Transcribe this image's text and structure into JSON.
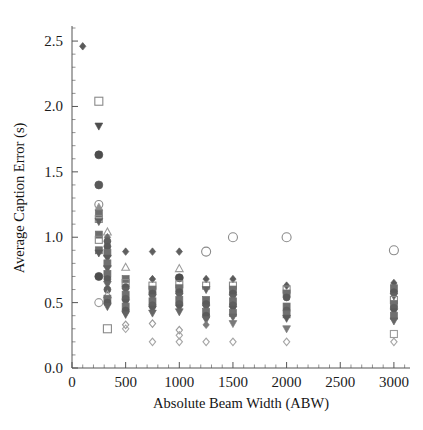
{
  "chart_data": {
    "type": "scatter",
    "title": "",
    "xlabel": "Absolute Beam Width (ABW)",
    "ylabel": "Average Caption Error (s)",
    "xlim": [
      0,
      3150
    ],
    "ylim": [
      0.0,
      2.6
    ],
    "xticks": [
      0,
      500,
      1000,
      1500,
      2000,
      2500,
      3000
    ],
    "xticklabels": [
      "0",
      "500",
      "1000",
      "1500",
      "2000",
      "2500",
      "3000"
    ],
    "yticks": [
      0.0,
      0.5,
      1.0,
      1.5,
      2.0,
      2.5
    ],
    "yticklabels": [
      "0.0",
      "0.5",
      "1.0",
      "1.5",
      "2.0",
      "2.5"
    ],
    "x_minor_tick_step": 100,
    "y_minor_tick_step": 0.1,
    "grid": false,
    "legend": null,
    "marker_shapes": [
      "circle-open",
      "circle-filled",
      "square-open",
      "square-filled",
      "triangle-up-open",
      "triangle-up-filled",
      "triangle-down-filled",
      "diamond-open",
      "diamond-filled"
    ],
    "marker_colors": {
      "dark_gray": "#4d4d4d",
      "mid_gray": "#6e6e6e",
      "light_gray": "#9b9b9b",
      "outline_gray": "#8a8a8a"
    },
    "points": [
      {
        "x": 100,
        "y": 2.46,
        "shape": "diamond-filled",
        "color": "#5a5a5a",
        "size": 6
      },
      {
        "x": 250,
        "y": 2.04,
        "shape": "square-open",
        "color": "#8a8a8a",
        "size": 8
      },
      {
        "x": 250,
        "y": 1.85,
        "shape": "triangle-down-filled",
        "color": "#4d4d4d",
        "size": 7
      },
      {
        "x": 250,
        "y": 1.63,
        "shape": "circle-filled",
        "color": "#4d4d4d",
        "size": 8
      },
      {
        "x": 250,
        "y": 1.4,
        "shape": "circle-filled",
        "color": "#595959",
        "size": 8
      },
      {
        "x": 250,
        "y": 1.25,
        "shape": "circle-open",
        "color": "#8a8a8a",
        "size": 8
      },
      {
        "x": 250,
        "y": 1.23,
        "shape": "triangle-up-filled",
        "color": "#909090",
        "size": 7
      },
      {
        "x": 250,
        "y": 1.18,
        "shape": "square-filled",
        "color": "#6e6e6e",
        "size": 7
      },
      {
        "x": 250,
        "y": 1.14,
        "shape": "square-open",
        "color": "#8a8a8a",
        "size": 7
      },
      {
        "x": 250,
        "y": 1.12,
        "shape": "triangle-down-filled",
        "color": "#5f5f5f",
        "size": 7
      },
      {
        "x": 250,
        "y": 1.02,
        "shape": "square-filled",
        "color": "#6e6e6e",
        "size": 7
      },
      {
        "x": 250,
        "y": 0.98,
        "shape": "square-open",
        "color": "#8a8a8a",
        "size": 7
      },
      {
        "x": 250,
        "y": 0.9,
        "shape": "square-filled",
        "color": "#6e6e6e",
        "size": 7
      },
      {
        "x": 250,
        "y": 0.88,
        "shape": "triangle-down-filled",
        "color": "#5a5a5a",
        "size": 7
      },
      {
        "x": 250,
        "y": 0.7,
        "shape": "circle-filled",
        "color": "#4d4d4d",
        "size": 8
      },
      {
        "x": 250,
        "y": 0.5,
        "shape": "circle-open",
        "color": "#9b9b9b",
        "size": 8
      },
      {
        "x": 330,
        "y": 1.04,
        "shape": "triangle-up-open",
        "color": "#9b9b9b",
        "size": 7
      },
      {
        "x": 330,
        "y": 1.0,
        "shape": "diamond-filled",
        "color": "#6e6e6e",
        "size": 6
      },
      {
        "x": 330,
        "y": 0.97,
        "shape": "circle-filled",
        "color": "#5f5f5f",
        "size": 7
      },
      {
        "x": 330,
        "y": 0.93,
        "shape": "circle-filled",
        "color": "#5a5a5a",
        "size": 7
      },
      {
        "x": 330,
        "y": 0.88,
        "shape": "square-filled",
        "color": "#6e6e6e",
        "size": 7
      },
      {
        "x": 330,
        "y": 0.84,
        "shape": "triangle-down-filled",
        "color": "#5a5a5a",
        "size": 7
      },
      {
        "x": 330,
        "y": 0.8,
        "shape": "square-filled",
        "color": "#707070",
        "size": 7
      },
      {
        "x": 330,
        "y": 0.76,
        "shape": "triangle-down-filled",
        "color": "#626262",
        "size": 7
      },
      {
        "x": 330,
        "y": 0.72,
        "shape": "square-filled",
        "color": "#6e6e6e",
        "size": 7
      },
      {
        "x": 330,
        "y": 0.68,
        "shape": "circle-filled",
        "color": "#5a5a5a",
        "size": 7
      },
      {
        "x": 330,
        "y": 0.64,
        "shape": "triangle-down-filled",
        "color": "#666666",
        "size": 7
      },
      {
        "x": 330,
        "y": 0.6,
        "shape": "circle-filled",
        "color": "#5f5f5f",
        "size": 7
      },
      {
        "x": 330,
        "y": 0.56,
        "shape": "triangle-up-open",
        "color": "#9b9b9b",
        "size": 7
      },
      {
        "x": 330,
        "y": 0.53,
        "shape": "square-filled",
        "color": "#6e6e6e",
        "size": 7
      },
      {
        "x": 330,
        "y": 0.5,
        "shape": "circle-filled",
        "color": "#5a5a5a",
        "size": 7
      },
      {
        "x": 330,
        "y": 0.47,
        "shape": "triangle-down-filled",
        "color": "#626262",
        "size": 7
      },
      {
        "x": 330,
        "y": 0.3,
        "shape": "square-open",
        "color": "#8a8a8a",
        "size": 8
      },
      {
        "x": 500,
        "y": 0.89,
        "shape": "diamond-filled",
        "color": "#5f5f5f",
        "size": 6
      },
      {
        "x": 500,
        "y": 0.77,
        "shape": "triangle-up-open",
        "color": "#9b9b9b",
        "size": 7
      },
      {
        "x": 500,
        "y": 0.68,
        "shape": "square-filled",
        "color": "#6e6e6e",
        "size": 7
      },
      {
        "x": 500,
        "y": 0.65,
        "shape": "square-open",
        "color": "#8a8a8a",
        "size": 7
      },
      {
        "x": 500,
        "y": 0.62,
        "shape": "circle-filled",
        "color": "#5a5a5a",
        "size": 7
      },
      {
        "x": 500,
        "y": 0.59,
        "shape": "triangle-down-filled",
        "color": "#626262",
        "size": 7
      },
      {
        "x": 500,
        "y": 0.56,
        "shape": "square-filled",
        "color": "#6e6e6e",
        "size": 7
      },
      {
        "x": 500,
        "y": 0.53,
        "shape": "circle-filled",
        "color": "#5f5f5f",
        "size": 7
      },
      {
        "x": 500,
        "y": 0.5,
        "shape": "triangle-down-filled",
        "color": "#5a5a5a",
        "size": 7
      },
      {
        "x": 500,
        "y": 0.47,
        "shape": "square-filled",
        "color": "#707070",
        "size": 7
      },
      {
        "x": 500,
        "y": 0.44,
        "shape": "circle-filled",
        "color": "#5a5a5a",
        "size": 7
      },
      {
        "x": 500,
        "y": 0.41,
        "shape": "triangle-down-filled",
        "color": "#626262",
        "size": 7
      },
      {
        "x": 500,
        "y": 0.33,
        "shape": "diamond-open",
        "color": "#9b9b9b",
        "size": 6
      },
      {
        "x": 500,
        "y": 0.3,
        "shape": "diamond-open",
        "color": "#a5a5a5",
        "size": 6
      },
      {
        "x": 750,
        "y": 0.89,
        "shape": "diamond-filled",
        "color": "#5f5f5f",
        "size": 6
      },
      {
        "x": 750,
        "y": 0.68,
        "shape": "diamond-filled",
        "color": "#5a5a5a",
        "size": 6
      },
      {
        "x": 750,
        "y": 0.63,
        "shape": "square-open",
        "color": "#8a8a8a",
        "size": 7
      },
      {
        "x": 750,
        "y": 0.6,
        "shape": "square-filled",
        "color": "#6e6e6e",
        "size": 7
      },
      {
        "x": 750,
        "y": 0.57,
        "shape": "circle-filled",
        "color": "#5a5a5a",
        "size": 7
      },
      {
        "x": 750,
        "y": 0.54,
        "shape": "triangle-down-filled",
        "color": "#626262",
        "size": 7
      },
      {
        "x": 750,
        "y": 0.51,
        "shape": "square-filled",
        "color": "#6e6e6e",
        "size": 7
      },
      {
        "x": 750,
        "y": 0.48,
        "shape": "circle-filled",
        "color": "#5f5f5f",
        "size": 7
      },
      {
        "x": 750,
        "y": 0.45,
        "shape": "triangle-down-filled",
        "color": "#5a5a5a",
        "size": 7
      },
      {
        "x": 750,
        "y": 0.42,
        "shape": "triangle-down-filled",
        "color": "#666666",
        "size": 7
      },
      {
        "x": 750,
        "y": 0.34,
        "shape": "diamond-open",
        "color": "#9b9b9b",
        "size": 6
      },
      {
        "x": 750,
        "y": 0.2,
        "shape": "diamond-open",
        "color": "#a5a5a5",
        "size": 6
      },
      {
        "x": 1000,
        "y": 0.89,
        "shape": "diamond-filled",
        "color": "#5f5f5f",
        "size": 6
      },
      {
        "x": 1000,
        "y": 0.76,
        "shape": "triangle-up-open",
        "color": "#9b9b9b",
        "size": 7
      },
      {
        "x": 1000,
        "y": 0.69,
        "shape": "circle-filled",
        "color": "#4d4d4d",
        "size": 8
      },
      {
        "x": 1000,
        "y": 0.64,
        "shape": "square-open",
        "color": "#8a8a8a",
        "size": 7
      },
      {
        "x": 1000,
        "y": 0.61,
        "shape": "square-filled",
        "color": "#6e6e6e",
        "size": 7
      },
      {
        "x": 1000,
        "y": 0.58,
        "shape": "circle-filled",
        "color": "#5a5a5a",
        "size": 7
      },
      {
        "x": 1000,
        "y": 0.55,
        "shape": "triangle-down-filled",
        "color": "#626262",
        "size": 7
      },
      {
        "x": 1000,
        "y": 0.52,
        "shape": "square-filled",
        "color": "#6e6e6e",
        "size": 7
      },
      {
        "x": 1000,
        "y": 0.49,
        "shape": "circle-filled",
        "color": "#5f5f5f",
        "size": 7
      },
      {
        "x": 1000,
        "y": 0.46,
        "shape": "triangle-down-filled",
        "color": "#5a5a5a",
        "size": 7
      },
      {
        "x": 1000,
        "y": 0.43,
        "shape": "triangle-down-filled",
        "color": "#666666",
        "size": 7
      },
      {
        "x": 1000,
        "y": 0.29,
        "shape": "diamond-open",
        "color": "#9b9b9b",
        "size": 6
      },
      {
        "x": 1000,
        "y": 0.25,
        "shape": "diamond-open",
        "color": "#a5a5a5",
        "size": 6
      },
      {
        "x": 1000,
        "y": 0.2,
        "shape": "diamond-open",
        "color": "#a5a5a5",
        "size": 6
      },
      {
        "x": 1250,
        "y": 0.89,
        "shape": "circle-open",
        "color": "#8a8a8a",
        "size": 9
      },
      {
        "x": 1250,
        "y": 0.68,
        "shape": "diamond-filled",
        "color": "#5a5a5a",
        "size": 6
      },
      {
        "x": 1250,
        "y": 0.63,
        "shape": "square-open",
        "color": "#8a8a8a",
        "size": 7
      },
      {
        "x": 1250,
        "y": 0.6,
        "shape": "triangle-down-filled",
        "color": "#626262",
        "size": 7
      },
      {
        "x": 1250,
        "y": 0.52,
        "shape": "square-filled",
        "color": "#6e6e6e",
        "size": 7
      },
      {
        "x": 1250,
        "y": 0.49,
        "shape": "circle-filled",
        "color": "#5a5a5a",
        "size": 7
      },
      {
        "x": 1250,
        "y": 0.46,
        "shape": "triangle-down-filled",
        "color": "#5f5f5f",
        "size": 7
      },
      {
        "x": 1250,
        "y": 0.43,
        "shape": "square-filled",
        "color": "#707070",
        "size": 7
      },
      {
        "x": 1250,
        "y": 0.4,
        "shape": "circle-filled",
        "color": "#5a5a5a",
        "size": 7
      },
      {
        "x": 1250,
        "y": 0.37,
        "shape": "triangle-down-filled",
        "color": "#666666",
        "size": 7
      },
      {
        "x": 1250,
        "y": 0.33,
        "shape": "diamond-filled",
        "color": "#7a7a7a",
        "size": 6
      },
      {
        "x": 1250,
        "y": 0.2,
        "shape": "diamond-open",
        "color": "#a5a5a5",
        "size": 6
      },
      {
        "x": 1500,
        "y": 1.0,
        "shape": "circle-open",
        "color": "#8a8a8a",
        "size": 9
      },
      {
        "x": 1500,
        "y": 0.68,
        "shape": "diamond-filled",
        "color": "#5a5a5a",
        "size": 6
      },
      {
        "x": 1500,
        "y": 0.63,
        "shape": "square-open",
        "color": "#8a8a8a",
        "size": 7
      },
      {
        "x": 1500,
        "y": 0.6,
        "shape": "square-filled",
        "color": "#6e6e6e",
        "size": 7
      },
      {
        "x": 1500,
        "y": 0.57,
        "shape": "circle-filled",
        "color": "#5a5a5a",
        "size": 7
      },
      {
        "x": 1500,
        "y": 0.54,
        "shape": "triangle-down-filled",
        "color": "#626262",
        "size": 7
      },
      {
        "x": 1500,
        "y": 0.51,
        "shape": "square-filled",
        "color": "#6e6e6e",
        "size": 7
      },
      {
        "x": 1500,
        "y": 0.48,
        "shape": "circle-filled",
        "color": "#5f5f5f",
        "size": 7
      },
      {
        "x": 1500,
        "y": 0.45,
        "shape": "triangle-down-filled",
        "color": "#5a5a5a",
        "size": 7
      },
      {
        "x": 1500,
        "y": 0.42,
        "shape": "square-filled",
        "color": "#707070",
        "size": 7
      },
      {
        "x": 1500,
        "y": 0.39,
        "shape": "triangle-down-filled",
        "color": "#666666",
        "size": 7
      },
      {
        "x": 1500,
        "y": 0.34,
        "shape": "triangle-down-filled",
        "color": "#7a7a7a",
        "size": 7
      },
      {
        "x": 1500,
        "y": 0.2,
        "shape": "diamond-open",
        "color": "#a5a5a5",
        "size": 6
      },
      {
        "x": 2000,
        "y": 1.0,
        "shape": "circle-open",
        "color": "#8a8a8a",
        "size": 9
      },
      {
        "x": 2000,
        "y": 0.63,
        "shape": "diamond-filled",
        "color": "#5a5a5a",
        "size": 6
      },
      {
        "x": 2000,
        "y": 0.6,
        "shape": "square-open",
        "color": "#8a8a8a",
        "size": 7
      },
      {
        "x": 2000,
        "y": 0.57,
        "shape": "square-filled",
        "color": "#6e6e6e",
        "size": 7
      },
      {
        "x": 2000,
        "y": 0.54,
        "shape": "circle-filled",
        "color": "#5a5a5a",
        "size": 7
      },
      {
        "x": 2000,
        "y": 0.47,
        "shape": "square-filled",
        "color": "#6e6e6e",
        "size": 7
      },
      {
        "x": 2000,
        "y": 0.44,
        "shape": "circle-filled",
        "color": "#5f5f5f",
        "size": 7
      },
      {
        "x": 2000,
        "y": 0.41,
        "shape": "square-filled",
        "color": "#707070",
        "size": 7
      },
      {
        "x": 2000,
        "y": 0.38,
        "shape": "triangle-down-filled",
        "color": "#5a5a5a",
        "size": 7
      },
      {
        "x": 2000,
        "y": 0.3,
        "shape": "triangle-down-filled",
        "color": "#7a7a7a",
        "size": 7
      },
      {
        "x": 2000,
        "y": 0.2,
        "shape": "diamond-open",
        "color": "#a5a5a5",
        "size": 6
      },
      {
        "x": 3000,
        "y": 0.9,
        "shape": "circle-open",
        "color": "#8a8a8a",
        "size": 9
      },
      {
        "x": 3000,
        "y": 0.65,
        "shape": "diamond-filled",
        "color": "#5a5a5a",
        "size": 6
      },
      {
        "x": 3000,
        "y": 0.61,
        "shape": "square-filled",
        "color": "#6e6e6e",
        "size": 7
      },
      {
        "x": 3000,
        "y": 0.58,
        "shape": "circle-filled",
        "color": "#5a5a5a",
        "size": 7
      },
      {
        "x": 3000,
        "y": 0.55,
        "shape": "triangle-down-filled",
        "color": "#626262",
        "size": 7
      },
      {
        "x": 3000,
        "y": 0.52,
        "shape": "square-open",
        "color": "#8a8a8a",
        "size": 7
      },
      {
        "x": 3000,
        "y": 0.49,
        "shape": "square-filled",
        "color": "#6e6e6e",
        "size": 7
      },
      {
        "x": 3000,
        "y": 0.46,
        "shape": "circle-filled",
        "color": "#5f5f5f",
        "size": 7
      },
      {
        "x": 3000,
        "y": 0.43,
        "shape": "triangle-down-filled",
        "color": "#5a5a5a",
        "size": 7
      },
      {
        "x": 3000,
        "y": 0.4,
        "shape": "square-filled",
        "color": "#707070",
        "size": 7
      },
      {
        "x": 3000,
        "y": 0.36,
        "shape": "triangle-down-filled",
        "color": "#666666",
        "size": 7
      },
      {
        "x": 3000,
        "y": 0.26,
        "shape": "square-open",
        "color": "#9b9b9b",
        "size": 7
      },
      {
        "x": 3000,
        "y": 0.2,
        "shape": "diamond-open",
        "color": "#a5a5a5",
        "size": 6
      }
    ]
  }
}
